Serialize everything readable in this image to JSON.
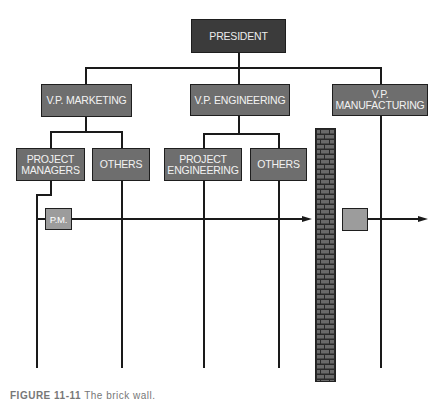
{
  "diagram": {
    "type": "organization-chart",
    "nodes": {
      "president": {
        "label": "PRESIDENT"
      },
      "vp_marketing": {
        "label": "V.P. MARKETING"
      },
      "vp_engineering": {
        "label": "V.P. ENGINEERING"
      },
      "vp_manufacturing": {
        "line1": "V.P.",
        "line2": "MANUFACTURING"
      },
      "project_managers": {
        "line1": "PROJECT",
        "line2": "MANAGERS"
      },
      "marketing_others": {
        "label": "OTHERS"
      },
      "project_engineering": {
        "line1": "PROJECT",
        "line2": "ENGINEERING"
      },
      "engineering_others": {
        "label": "OTHERS"
      },
      "pm": {
        "label": "P.M."
      },
      "handoff_box": {
        "label": ""
      }
    },
    "elements": {
      "brick_wall": "brick-wall"
    }
  },
  "caption": {
    "figure": "FIGURE 11-11",
    "title": "The brick wall."
  },
  "colors": {
    "dark_box": "#3b3b3b",
    "mid_box": "#6e6e6e",
    "light_box": "#9c9c9c",
    "line": "#1a1a1a"
  }
}
